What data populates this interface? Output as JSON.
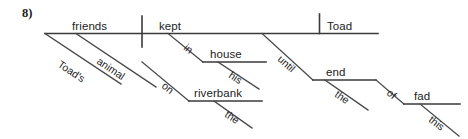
{
  "exercise": {
    "number_label": "8)"
  },
  "diagram": {
    "type": "sentence-diagram",
    "sentence": "Toad's animal friends kept in his house on the riverbank until the end of this fad Toad.",
    "colors": {
      "line": "#3a3a3a",
      "text": "#222222",
      "background": "#ffffff"
    },
    "baseline": {
      "subject": "friends",
      "verb": "kept",
      "object": "Toad"
    },
    "words": {
      "subject": "friends",
      "verb": "kept",
      "object": "Toad",
      "subject_mod_1": "animal",
      "subject_mod_2": "Toad's",
      "prep_1": "in",
      "prep_1_object": "house",
      "prep_1_object_mod": "his",
      "prep_2": "on",
      "prep_2_object": "riverbank",
      "prep_2_object_mod": "the",
      "prep_3": "until",
      "prep_3_object": "end",
      "prep_3_object_mod": "the",
      "prep_4": "of",
      "prep_4_object": "fad",
      "prep_4_object_mod": "this"
    }
  }
}
